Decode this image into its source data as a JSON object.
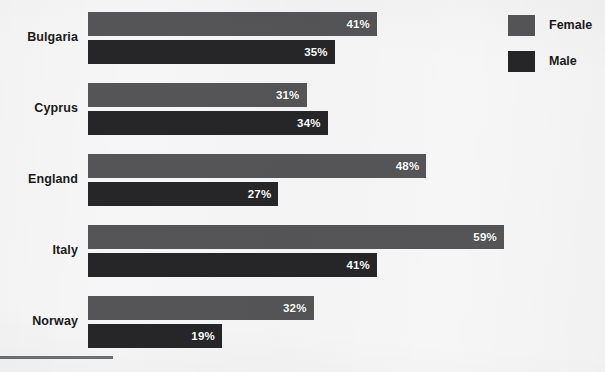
{
  "chart_data": {
    "type": "bar",
    "orientation": "horizontal",
    "title": "",
    "subtitle": "",
    "xlabel": "",
    "ylabel": "",
    "grid": false,
    "xlim": [
      0,
      72
    ],
    "value_suffix": "%",
    "legend_position": "top-right",
    "categories": [
      "Bulgaria",
      "Cyprus",
      "England",
      "Italy",
      "Norway"
    ],
    "series": [
      {
        "name": "Female",
        "color": "#555557",
        "values": [
          41,
          31,
          48,
          59,
          32
        ],
        "labels": [
          "41%",
          "31%",
          "48%",
          "59%",
          "32%"
        ]
      },
      {
        "name": "Male",
        "color": "#262628",
        "values": [
          35,
          34,
          27,
          41,
          19
        ],
        "labels": [
          "35%",
          "34%",
          "27%",
          "41%",
          "19%"
        ]
      }
    ]
  },
  "legend": {
    "items": [
      {
        "label": "Female",
        "color": "#555557"
      },
      {
        "label": "Male",
        "color": "#262628"
      }
    ]
  },
  "colors": {
    "background": "#f6f6f7",
    "female": "#555557",
    "male": "#262628",
    "text": "#1a1a1a",
    "value_text": "#ffffff",
    "rule": "#6e7074"
  }
}
